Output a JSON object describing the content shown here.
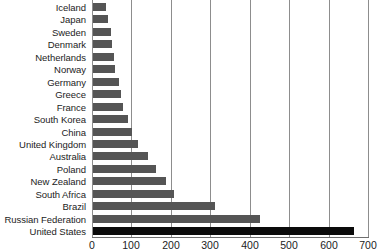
{
  "chart_data": {
    "type": "bar",
    "orientation": "horizontal",
    "title": "",
    "subtitle": "",
    "xlabel": "",
    "ylabel": "",
    "xlim": [
      0,
      700
    ],
    "xticks": [
      0,
      100,
      200,
      300,
      400,
      500,
      600,
      700
    ],
    "grid": "vertical",
    "legend": "none",
    "categories": [
      "Iceland",
      "Japan",
      "Sweden",
      "Denmark",
      "Netherlands",
      "Norway",
      "Germany",
      "Greece",
      "France",
      "South Korea",
      "China",
      "United Kingdom",
      "Australia",
      "Poland",
      "New Zealand",
      "South Africa",
      "Brazil",
      "Russian Federation",
      "United States"
    ],
    "values": [
      34,
      38,
      46,
      49,
      52,
      56,
      65,
      71,
      77,
      88,
      98,
      115,
      140,
      161,
      186,
      205,
      310,
      424,
      662
    ],
    "highlight_category": "United States",
    "colors": {
      "bar": "#555555",
      "bar_highlight": "#0b0b0b",
      "gridline": "#8d8d8d",
      "axis": "#6e6e6e",
      "text": "#1c1c1c",
      "background": "#ffffff"
    }
  }
}
